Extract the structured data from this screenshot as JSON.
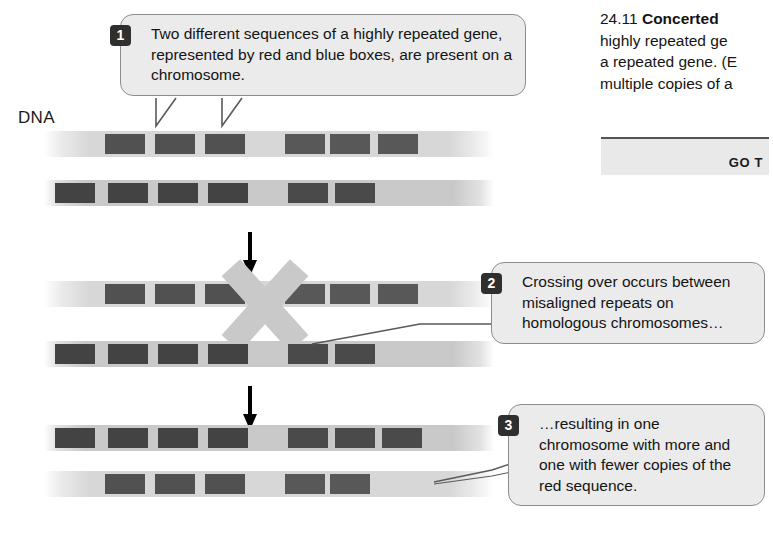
{
  "figure": {
    "dna_label": "DNA",
    "caption_number": "24.11",
    "caption_bold": "Concerted",
    "caption_lines": [
      "highly repeated ge",
      "a repeated gene. (E",
      "multiple copies of a"
    ],
    "go_button_label": "GO T"
  },
  "callouts": [
    {
      "number": "1",
      "text": "Two different sequences of a highly repeated gene, represented by red and blue boxes, are present on a chromosome."
    },
    {
      "number": "2",
      "text": "Crossing over occurs between misaligned repeats on homologous chromosomes…"
    },
    {
      "number": "3",
      "text": "…resulting in one chromosome with more and one with fewer copies of the red sequence."
    }
  ],
  "colors": {
    "repeat_box": "#434343",
    "strand": "#c9c9c9",
    "strand_faint": "#d4d4d4",
    "callout_fill": "#ebebeb",
    "callout_border": "#8d8d8d",
    "badge": "#2f2f2f"
  },
  "diagram": {
    "stages": [
      {
        "stage_name": "before-crossover",
        "strands": [
          {
            "strand_name": "chromosome-1-top",
            "box_count": 6,
            "box_x": [
              105,
              155,
              205,
              285,
              330,
              378
            ]
          },
          {
            "strand_name": "chromosome-2-top",
            "box_count": 6,
            "box_x": [
              55,
              108,
              158,
              208,
              288,
              335
            ]
          }
        ]
      },
      {
        "stage_name": "crossover",
        "strands": [
          {
            "strand_name": "chromosome-1-mid",
            "box_count": 6,
            "box_x": [
              105,
              155,
              205,
              285,
              330,
              378
            ]
          },
          {
            "strand_name": "chromosome-2-mid",
            "box_count": 6,
            "box_x": [
              55,
              108,
              158,
              208,
              288,
              335
            ]
          }
        ],
        "crossover_x": 260
      },
      {
        "stage_name": "after-crossover",
        "strands": [
          {
            "strand_name": "chromosome-1-result",
            "box_count": 7,
            "box_x": [
              55,
              108,
              158,
              208,
              288,
              335,
              382
            ]
          },
          {
            "strand_name": "chromosome-2-result",
            "box_count": 5,
            "box_x": [
              105,
              155,
              205,
              285,
              330
            ]
          }
        ]
      }
    ],
    "arrows": [
      "arrow-down-1",
      "arrow-down-2"
    ]
  }
}
